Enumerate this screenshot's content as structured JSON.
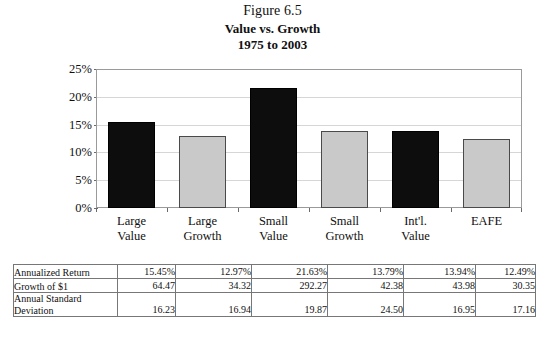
{
  "figure": {
    "number": "Figure 6.5",
    "title": "Value vs. Growth",
    "subtitle": "1975 to 2003"
  },
  "chart_data": {
    "type": "bar",
    "title": "Value vs. Growth",
    "subtitle": "1975 to 2003",
    "figure_label": "Figure 6.5",
    "xlabel": "",
    "ylabel": "",
    "ylim": [
      0,
      25
    ],
    "ytick_labels": [
      "0%",
      "5%",
      "10%",
      "15%",
      "20%",
      "25%"
    ],
    "ytick_values": [
      0,
      5,
      10,
      15,
      20,
      25
    ],
    "grid": true,
    "legend": "none",
    "categories": [
      "Large\nValue",
      "Large\nGrowth",
      "Small\nValue",
      "Small\nGrowth",
      "Int'l.\nValue",
      "EAFE"
    ],
    "values": [
      15.45,
      12.97,
      21.63,
      13.79,
      13.94,
      12.49
    ],
    "bar_colors": [
      "#0d0d0d",
      "#c9c9c9",
      "#0d0d0d",
      "#c9c9c9",
      "#0d0d0d",
      "#c9c9c9"
    ],
    "series": [
      {
        "name": "Annualized Return",
        "values": [
          15.45,
          12.97,
          21.63,
          13.79,
          13.94,
          12.49
        ]
      }
    ]
  },
  "table": {
    "row_labels": [
      "Annualized Return",
      "Growth of $1",
      "Annual Standard\nDeviation"
    ],
    "rows": [
      {
        "label": "Annualized Return",
        "values": [
          "15.45%",
          "12.97%",
          "21.63%",
          "13.79%",
          "13.94%",
          "12.49%"
        ]
      },
      {
        "label": "Growth of $1",
        "values": [
          "64.47",
          "34.32",
          "292.27",
          "42.38",
          "43.98",
          "30.35"
        ]
      },
      {
        "label": "Annual Standard\nDeviation",
        "values": [
          "16.23",
          "16.94",
          "19.87",
          "24.50",
          "16.95",
          "17.16"
        ]
      }
    ]
  },
  "colors": {
    "dark_bar": "#0d0d0d",
    "light_bar": "#c9c9c9",
    "gridline": "#d6d6d6",
    "frame": "#9a9a9a",
    "text": "#101010"
  }
}
